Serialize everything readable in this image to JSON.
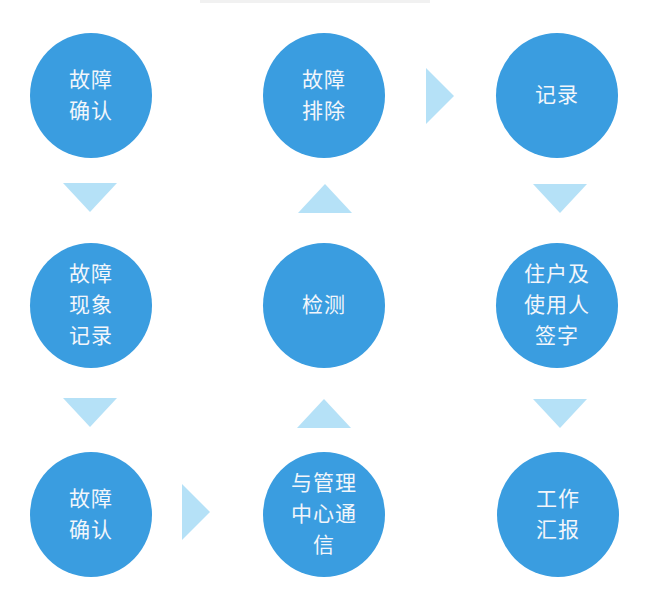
{
  "colors": {
    "node_fill": "#3a9de0",
    "node_text": "#f2f6fb",
    "arrow_fill": "#b5e1f7",
    "background": "#ffffff"
  },
  "nodes": [
    {
      "id": "fault-confirm-1",
      "lines": [
        "故障",
        "确认"
      ],
      "row": 1,
      "col": 1
    },
    {
      "id": "fault-clear",
      "lines": [
        "故障",
        "排除"
      ],
      "row": 1,
      "col": 2
    },
    {
      "id": "record",
      "lines": [
        "记录"
      ],
      "row": 1,
      "col": 3
    },
    {
      "id": "fault-phenomenon-record",
      "lines": [
        "故障",
        "现象",
        "记录"
      ],
      "row": 2,
      "col": 1
    },
    {
      "id": "inspect",
      "lines": [
        "检测"
      ],
      "row": 2,
      "col": 2
    },
    {
      "id": "resident-sign",
      "lines": [
        "住户及",
        "使用人",
        "签字"
      ],
      "row": 2,
      "col": 3
    },
    {
      "id": "fault-confirm-2",
      "lines": [
        "故障",
        "确认"
      ],
      "row": 3,
      "col": 1
    },
    {
      "id": "contact-management",
      "lines": [
        "与管理",
        "中心通",
        "信"
      ],
      "row": 3,
      "col": 2
    },
    {
      "id": "work-report",
      "lines": [
        "工作",
        "汇报"
      ],
      "row": 3,
      "col": 3
    }
  ],
  "arrows": [
    {
      "from": "fault-confirm-1",
      "to": "fault-phenomenon-record",
      "direction": "down"
    },
    {
      "from": "fault-phenomenon-record",
      "to": "fault-confirm-2",
      "direction": "down"
    },
    {
      "from": "fault-confirm-2",
      "to": "contact-management",
      "direction": "right"
    },
    {
      "from": "contact-management",
      "to": "inspect",
      "direction": "up"
    },
    {
      "from": "inspect",
      "to": "fault-clear",
      "direction": "up"
    },
    {
      "from": "fault-clear",
      "to": "record",
      "direction": "right"
    },
    {
      "from": "record",
      "to": "resident-sign",
      "direction": "down"
    },
    {
      "from": "resident-sign",
      "to": "work-report",
      "direction": "down"
    }
  ]
}
